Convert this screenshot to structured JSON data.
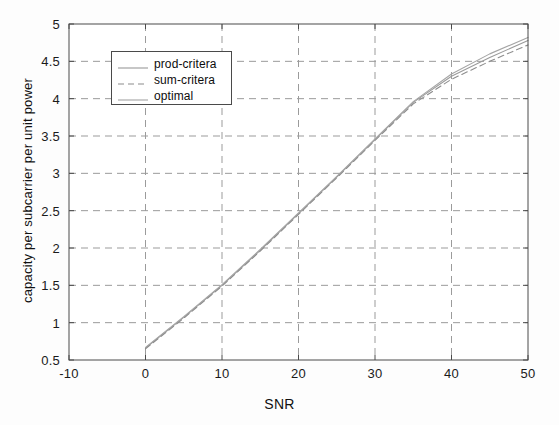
{
  "chart_data": {
    "type": "line",
    "title": "",
    "xlabel": "SNR",
    "ylabel": "capacity per subcarrier per unit power",
    "xlim": [
      -10,
      50
    ],
    "ylim": [
      0.5,
      5
    ],
    "xticks": [
      -10,
      0,
      10,
      20,
      30,
      40,
      50
    ],
    "yticks": [
      0.5,
      1,
      1.5,
      2,
      2.5,
      3,
      3.5,
      4,
      4.5,
      5
    ],
    "xtick_labels": [
      "-10",
      "0",
      "10",
      "20",
      "30",
      "40",
      "50"
    ],
    "ytick_labels": [
      "0.5",
      "1",
      "1.5",
      "2",
      "2.5",
      "3",
      "3.5",
      "4",
      "4.5",
      "5"
    ],
    "grid": true,
    "grid_style": "dashed",
    "legend_position": "upper-left",
    "x": [
      0,
      5,
      10,
      15,
      20,
      25,
      30,
      35,
      40,
      45,
      50
    ],
    "series": [
      {
        "name": "prod-critera",
        "style": "solid",
        "color": "#9a9a9a",
        "values": [
          0.66,
          1.07,
          1.5,
          1.97,
          2.46,
          2.95,
          3.45,
          3.95,
          4.3,
          4.55,
          4.78
        ]
      },
      {
        "name": "sum-critera",
        "style": "dashed",
        "color": "#8c8c8c",
        "values": [
          0.65,
          1.06,
          1.49,
          1.96,
          2.45,
          2.94,
          3.44,
          3.93,
          4.26,
          4.5,
          4.72
        ]
      },
      {
        "name": "optimal",
        "style": "solid",
        "color": "#a5a5a5",
        "values": [
          0.67,
          1.08,
          1.51,
          1.98,
          2.47,
          2.96,
          3.46,
          3.96,
          4.33,
          4.6,
          4.82
        ]
      }
    ]
  },
  "legend": {
    "entries": [
      {
        "label": "prod-critera"
      },
      {
        "label": "sum-critera"
      },
      {
        "label": "optimal"
      }
    ]
  },
  "colors": {
    "axis": "#4a4a4a",
    "grid": "#9b9b9b",
    "text": "#121212",
    "background": "#fdfdfd"
  }
}
